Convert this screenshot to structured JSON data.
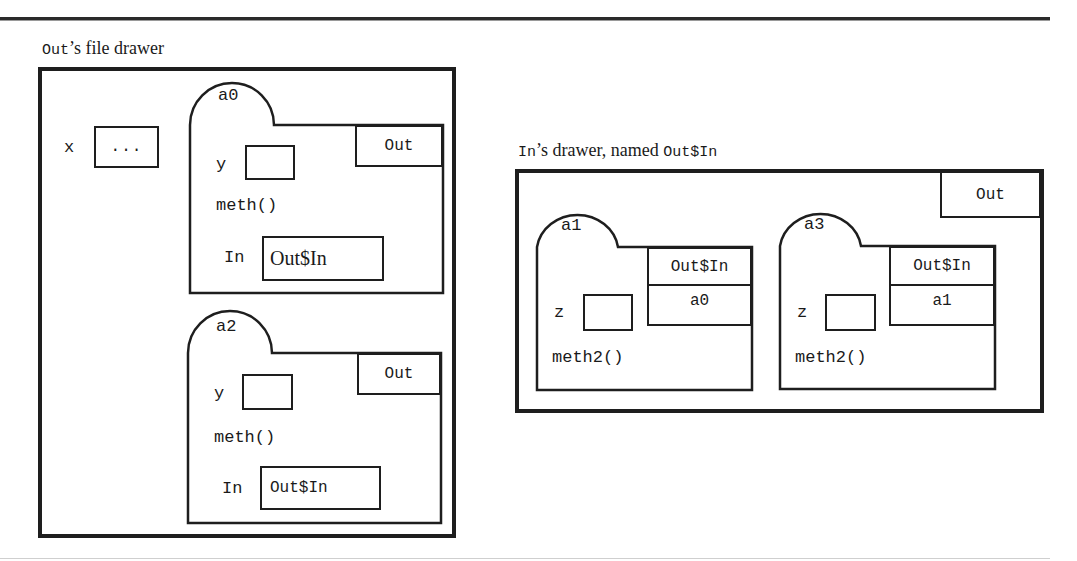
{
  "left_drawer": {
    "caption_code": "Out",
    "caption_text": "’s file drawer",
    "field_x": {
      "label": "x",
      "value": "..."
    },
    "objects": [
      {
        "name": "a0",
        "owner": "Out",
        "field_y_label": "y",
        "method": "meth()",
        "inner_label": "In",
        "inner_value": "Out$In",
        "inner_value_font": "serif"
      },
      {
        "name": "a2",
        "owner": "Out",
        "field_y_label": "y",
        "method": "meth()",
        "inner_label": "In",
        "inner_value": "Out$In",
        "inner_value_font": "mono"
      }
    ]
  },
  "right_drawer": {
    "caption_code_1": "In",
    "caption_text": "’s drawer, named ",
    "caption_code_2": "Out$In",
    "outer_label": "Out",
    "objects": [
      {
        "name": "a1",
        "class_cell": "Out$In",
        "outer_ref": "a0",
        "field_z_label": "z",
        "method": "meth2()"
      },
      {
        "name": "a3",
        "class_cell": "Out$In",
        "outer_ref": "a1",
        "field_z_label": "z",
        "method": "meth2()"
      }
    ]
  },
  "colors": {
    "ink": "#1e1e1e",
    "background": "#ffffff",
    "bottom_rule": "#cfcfcf"
  }
}
